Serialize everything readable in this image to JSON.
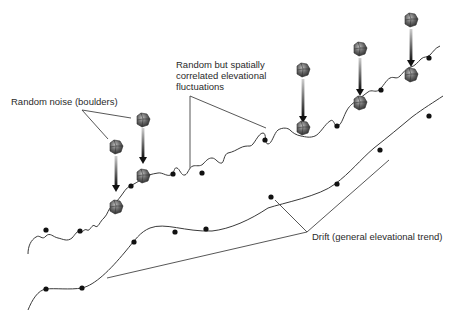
{
  "diagram": {
    "type": "conceptual-elevation-model",
    "labels": {
      "noise": "Random noise (boulders)",
      "correlated_line1": "Random but spatially",
      "correlated_line2": "correlated elevational",
      "correlated_line3": "fluctuations",
      "drift": "Drift (general elevational trend)"
    },
    "components": [
      {
        "name": "noise",
        "description": "Boulders dropped onto surface"
      },
      {
        "name": "correlated-fluctuations",
        "description": "Wavy surface profile"
      },
      {
        "name": "drift",
        "description": "Smooth underlying trend line"
      }
    ],
    "colors": {
      "line": "#3a3a3a",
      "dot": "#111111",
      "boulder": "#555555",
      "text": "#2a2a2a"
    }
  }
}
